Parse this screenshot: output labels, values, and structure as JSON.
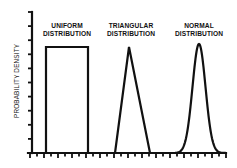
{
  "chart_data": {
    "type": "line",
    "title": "",
    "xlabel": "",
    "ylabel": "PROBABILITY DENSITY",
    "grid": false,
    "legend": "none",
    "series": [
      {
        "name": "UNIFORM DISTRIBUTION",
        "label_lines": [
          "UNIFORM",
          "DISTRIBUTION"
        ],
        "shape": "rectangle",
        "x": [
          46,
          46,
          88,
          88
        ],
        "y": [
          153,
          47,
          47,
          153
        ]
      },
      {
        "name": "TRIANGULAR DISTRIBUTION",
        "label_lines": [
          "TRIANGULAR",
          "DISTRIBUTION"
        ],
        "shape": "triangle",
        "x": [
          115,
          129,
          150
        ],
        "y": [
          153,
          47,
          153
        ]
      },
      {
        "name": "NORMAL DISTRIBUTION",
        "label_lines": [
          "NORMAL",
          "DISTRIBUTION"
        ],
        "shape": "bell-curve",
        "mean_x": 199,
        "peak_y": 44,
        "sigma_px": 6.5,
        "x_range": [
          175,
          226
        ]
      }
    ],
    "axes": {
      "y_axis_x": 32,
      "y_top": 12,
      "x_axis_y": 153,
      "x_right": 226,
      "y_tick_count": 10,
      "x_tick_count": 28,
      "x_tick_labels": [],
      "y_tick_labels": []
    }
  }
}
